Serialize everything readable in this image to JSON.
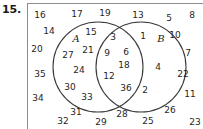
{
  "exercise": {
    "number_label": "15."
  },
  "diagram": {
    "type": "venn-two-set",
    "set_a_label": "A",
    "set_b_label": "B",
    "stroke_color": "#3a3a3a",
    "frame_color": "#8c8c8c",
    "regions": {
      "a_only": [
        15,
        27,
        21,
        24,
        30,
        33
      ],
      "intersection": [
        3,
        9,
        6,
        18,
        12,
        36
      ],
      "b_only": [
        1,
        4,
        2
      ],
      "outside": [
        16,
        17,
        19,
        13,
        5,
        8,
        14,
        10,
        20,
        7,
        35,
        22,
        34,
        11,
        32,
        31,
        29,
        28,
        25,
        26,
        23
      ]
    },
    "items": [
      {
        "value": "16",
        "x": 12,
        "y": 11,
        "region": "outside"
      },
      {
        "value": "17",
        "x": 49,
        "y": 10,
        "region": "outside"
      },
      {
        "value": "19",
        "x": 77,
        "y": 9,
        "region": "outside"
      },
      {
        "value": "13",
        "x": 110,
        "y": 11,
        "region": "outside"
      },
      {
        "value": "5",
        "x": 141,
        "y": 14,
        "region": "outside"
      },
      {
        "value": "8",
        "x": 164,
        "y": 11,
        "region": "outside"
      },
      {
        "value": "14",
        "x": 21,
        "y": 27,
        "region": "outside"
      },
      {
        "value": "10",
        "x": 147,
        "y": 31,
        "region": "outside"
      },
      {
        "value": "20",
        "x": 9,
        "y": 45,
        "region": "outside"
      },
      {
        "value": "7",
        "x": 160,
        "y": 49,
        "region": "outside"
      },
      {
        "value": "35",
        "x": 12,
        "y": 70,
        "region": "outside"
      },
      {
        "value": "22",
        "x": 155,
        "y": 70,
        "region": "outside"
      },
      {
        "value": "34",
        "x": 10,
        "y": 94,
        "region": "outside"
      },
      {
        "value": "11",
        "x": 162,
        "y": 90,
        "region": "outside"
      },
      {
        "value": "26",
        "x": 142,
        "y": 106,
        "region": "outside"
      },
      {
        "value": "23",
        "x": 167,
        "y": 118,
        "region": "outside"
      },
      {
        "value": "32",
        "x": 35,
        "y": 117,
        "region": "outside"
      },
      {
        "value": "31",
        "x": 48,
        "y": 108,
        "region": "outside"
      },
      {
        "value": "29",
        "x": 73,
        "y": 118,
        "region": "outside"
      },
      {
        "value": "28",
        "x": 94,
        "y": 110,
        "region": "outside"
      },
      {
        "value": "25",
        "x": 120,
        "y": 117,
        "region": "outside"
      },
      {
        "value": "15",
        "x": 63,
        "y": 28,
        "region": "a_only"
      },
      {
        "value": "21",
        "x": 60,
        "y": 46,
        "region": "a_only"
      },
      {
        "value": "27",
        "x": 40,
        "y": 51,
        "region": "a_only"
      },
      {
        "value": "24",
        "x": 51,
        "y": 66,
        "region": "a_only"
      },
      {
        "value": "30",
        "x": 42,
        "y": 83,
        "region": "a_only"
      },
      {
        "value": "33",
        "x": 59,
        "y": 93,
        "region": "a_only"
      },
      {
        "value": "3",
        "x": 85,
        "y": 33,
        "region": "intersection"
      },
      {
        "value": "9",
        "x": 79,
        "y": 49,
        "region": "intersection"
      },
      {
        "value": "6",
        "x": 98,
        "y": 48,
        "region": "intersection"
      },
      {
        "value": "18",
        "x": 96,
        "y": 61,
        "region": "intersection"
      },
      {
        "value": "12",
        "x": 81,
        "y": 72,
        "region": "intersection"
      },
      {
        "value": "36",
        "x": 98,
        "y": 84,
        "region": "intersection"
      },
      {
        "value": "1",
        "x": 115,
        "y": 32,
        "region": "b_only"
      },
      {
        "value": "4",
        "x": 130,
        "y": 63,
        "region": "b_only"
      },
      {
        "value": "2",
        "x": 117,
        "y": 86,
        "region": "b_only"
      }
    ],
    "circle_a": {
      "cx": 70,
      "cy": 63,
      "r": 45
    },
    "circle_b": {
      "cx": 113,
      "cy": 63,
      "r": 45
    },
    "label_a_pos": {
      "x": 48,
      "y": 34
    },
    "label_b_pos": {
      "x": 133,
      "y": 34
    }
  }
}
